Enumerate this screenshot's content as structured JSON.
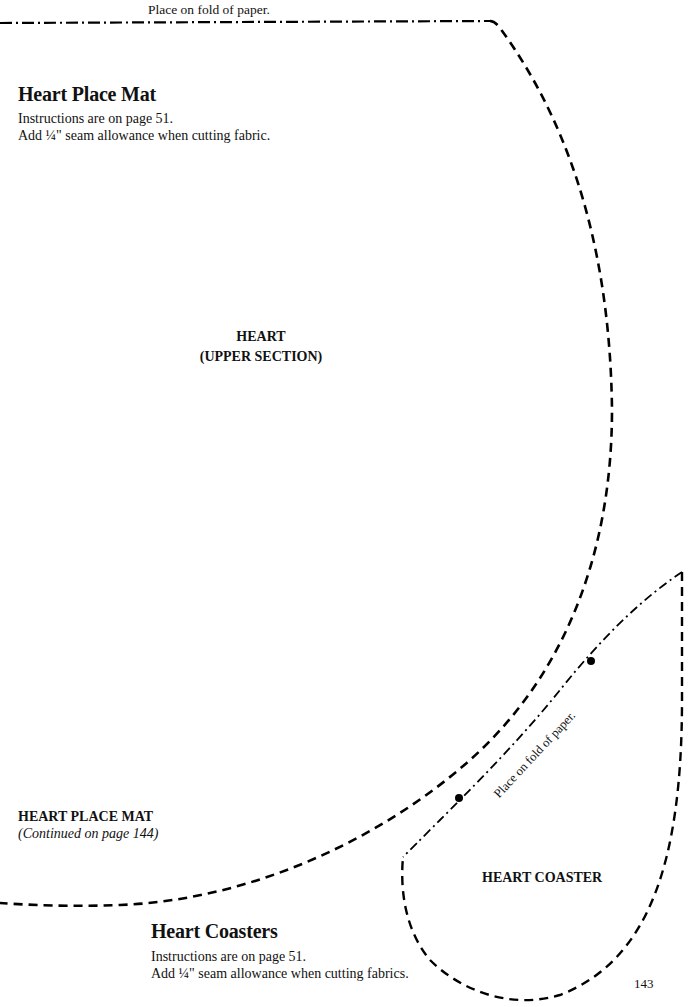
{
  "page": {
    "number": "143"
  },
  "place_mat": {
    "fold_label": "Place on fold of paper.",
    "title": "Heart Place Mat",
    "instructions": "Instructions are on page 51.",
    "seam_note": "Add ¼\" seam allowance when cutting fabric.",
    "piece_label_line1": "HEART",
    "piece_label_line2": "(UPPER SECTION)",
    "continued_title": "HEART PLACE MAT",
    "continued_note": "(Continued on page 144)"
  },
  "coasters": {
    "fold_label": "Place on fold of paper.",
    "piece_label": "HEART COASTER",
    "title": "Heart Coasters",
    "instructions": "Instructions are on page 51.",
    "seam_note": "Add ¼\" seam allowance when cutting fabrics."
  },
  "legend": {
    "cut_line_style": "dashed",
    "fold_line_style": "dash-dot",
    "line_color": "#000000"
  }
}
